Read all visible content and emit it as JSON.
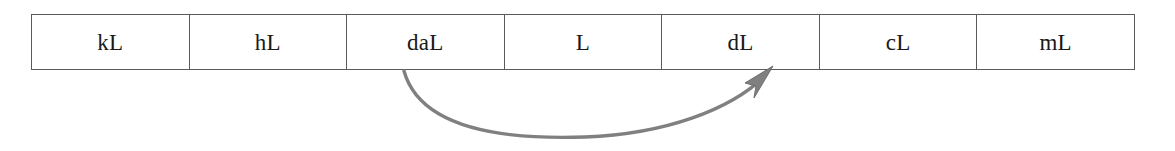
{
  "diagram": {
    "table": {
      "name": "metric-volume-units-row",
      "cells": [
        {
          "label": "kL"
        },
        {
          "label": "hL"
        },
        {
          "label": "daL"
        },
        {
          "label": "L"
        },
        {
          "label": "dL"
        },
        {
          "label": "cL"
        },
        {
          "label": "mL"
        }
      ]
    },
    "arrow": {
      "name": "conversion-arrow",
      "from_unit": "daL",
      "to_unit": "dL",
      "direction": "left-to-right",
      "style": "curved-arc-below-table",
      "color": "#808080",
      "head": "solid-triangle",
      "steps": 2
    },
    "colors": {
      "border": "#5a5a5a",
      "text": "#1a1a1a",
      "arrow": "#808080",
      "background": "#ffffff"
    }
  }
}
